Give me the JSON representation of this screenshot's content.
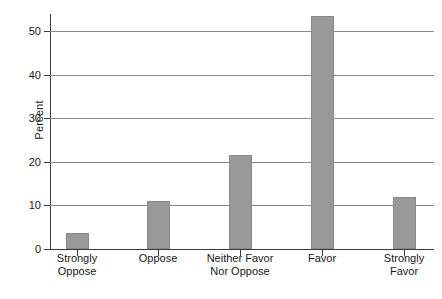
{
  "chart_data": {
    "type": "bar",
    "title": "",
    "xlabel": "",
    "ylabel": "Percent",
    "categories": [
      "Strongly\nOppose",
      "Oppose",
      "Neither Favor\nNor Oppose",
      "Favor",
      "Strongly\nFavor"
    ],
    "category_lines": [
      [
        "Strongly",
        "Oppose"
      ],
      [
        "Oppose"
      ],
      [
        "Neither Favor",
        "Nor Oppose"
      ],
      [
        "Favor"
      ],
      [
        "Strongly",
        "Favor"
      ]
    ],
    "values": [
      3.7,
      11.0,
      21.6,
      53.4,
      12.0
    ],
    "ylim": [
      0,
      53.4
    ],
    "yticks": [
      0,
      10,
      20,
      30,
      40,
      50
    ],
    "ytick_labels": [
      "0",
      "10",
      "20",
      "30",
      "40",
      "50"
    ],
    "grid": "horizontal",
    "legend": "none",
    "bar_color": "#999999",
    "axis_color": "#3a3a3a",
    "gridline_color": "#8c8c8c",
    "background_color": "#ffffff"
  }
}
